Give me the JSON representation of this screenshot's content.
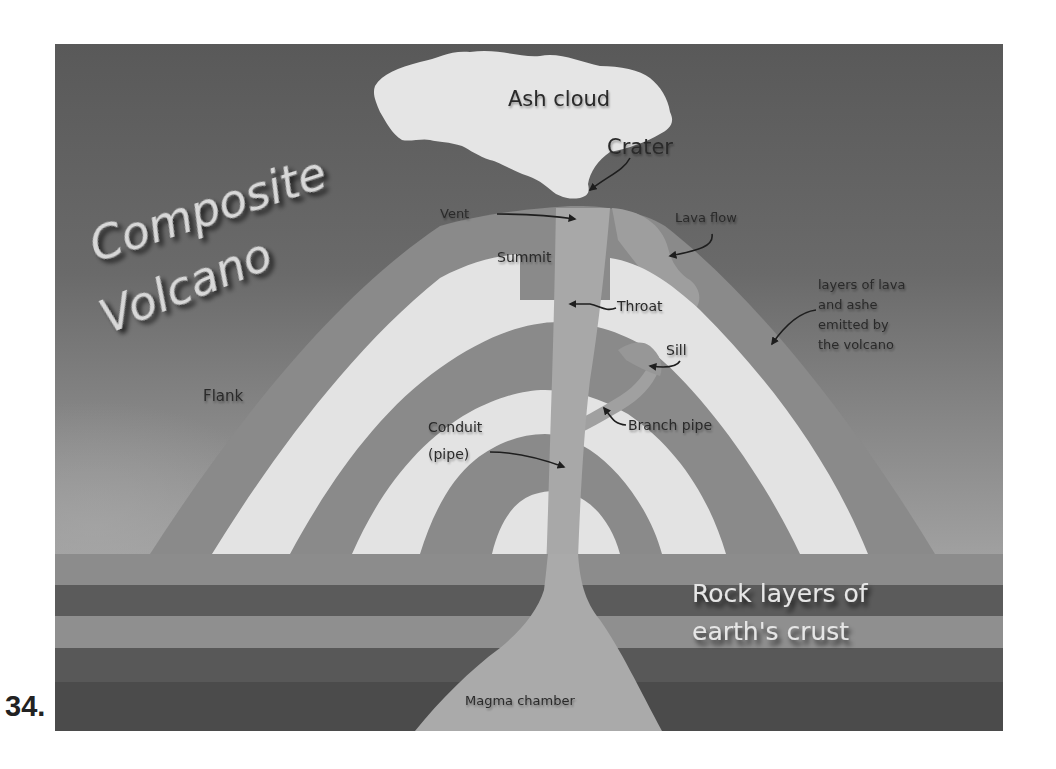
{
  "figure": {
    "number": "34.",
    "title_line1": "Composite",
    "title_line2": "Volcano"
  },
  "labels": {
    "ash_cloud": "Ash cloud",
    "crater": "Crater",
    "vent": "Vent",
    "lava_flow": "Lava flow",
    "summit": "Summit",
    "throat": "Throat",
    "layers_line1": "layers of lava",
    "layers_line2": "and ashe",
    "layers_line3": "emitted by",
    "layers_line4": "the volcano",
    "sill": "Sill",
    "flank": "Flank",
    "conduit_line1": "Conduit",
    "conduit_line2": "(pipe)",
    "branch_pipe": "Branch pipe",
    "rock_line1": "Rock layers of",
    "rock_line2": "earth's crust",
    "magma_chamber": "Magma chamber"
  },
  "colors": {
    "sky_top": "#5a5a5a",
    "sky_bottom": "#9a9a9a",
    "ash_cloud": "#e4e4e4",
    "lava_layer": "#8a8a8a",
    "ash_layer": "#e2e2e2",
    "conduit": "#a6a6a6",
    "strata": [
      "#8c8c8c",
      "#5a5a5a",
      "#8e8e8e",
      "#575757",
      "#4a4a4a"
    ],
    "magma": "#a9a9a9"
  }
}
